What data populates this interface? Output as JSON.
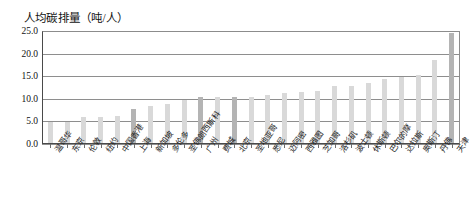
{
  "chart_data": {
    "type": "bar",
    "title": "人均碳排量（吨/人）",
    "xlabel": "",
    "ylabel": "",
    "ylim": [
      0.0,
      25.0
    ],
    "ytick_labels": [
      "25.0",
      "20.0",
      "15.0",
      "10.0",
      "5.0",
      "0.0"
    ],
    "ytick_values": [
      25.0,
      20.0,
      15.0,
      10.0,
      5.0,
      0.0
    ],
    "grid": true,
    "legend": null,
    "categories": [
      "温哥华",
      "东京",
      "伦敦",
      "纽约",
      "中国香港",
      "上海",
      "新加坡",
      "多伦多",
      "圣佛朗西斯科",
      "广州",
      "费城",
      "北京",
      "圣地亚哥",
      "悉尼",
      "迈阿密",
      "西雅图",
      "芝加哥",
      "洛杉矶",
      "波士顿",
      "休斯顿",
      "巴尔的摩",
      "达拉斯",
      "奥斯汀",
      "丹佛",
      "天津"
    ],
    "values": [
      4.9,
      4.9,
      5.9,
      6.0,
      6.2,
      7.8,
      8.3,
      8.8,
      9.7,
      10.5,
      10.3,
      10.5,
      10.3,
      10.8,
      11.3,
      11.5,
      11.8,
      12.8,
      12.8,
      13.4,
      14.3,
      14.8,
      15.2,
      18.5,
      24.5
    ],
    "highlighted_indices": [
      5,
      9,
      11,
      24
    ],
    "colors": {
      "bar": "#d9d9d9",
      "bar_highlight": "#b4b4b4",
      "grid": "#8e8e8e",
      "axis": "#4a4a4a",
      "text": "#111111"
    }
  }
}
